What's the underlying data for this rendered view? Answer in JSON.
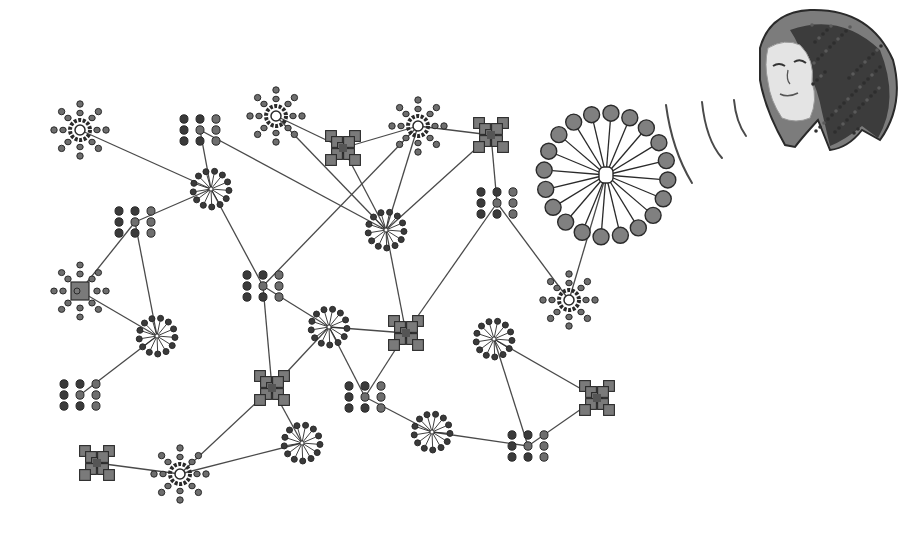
{
  "diagram": {
    "title": "",
    "width": 923,
    "height": 542,
    "colors": {
      "background": "#ffffff",
      "edge": "#4a4a4a",
      "node_fill": "#6e6e6e",
      "node_dark": "#3a3a3a",
      "node_stroke": "#2a2a2a",
      "x_fill": "#7a7a7a",
      "big_spoke_fill": "#808080",
      "face_skin": "#e4e4e4",
      "hair_dark": "#3c3c3c",
      "hair_mid": "#7c7c7c"
    },
    "nodes": [
      {
        "id": "A",
        "type": "sun",
        "x": 80,
        "y": 130
      },
      {
        "id": "B",
        "type": "grid",
        "x": 200,
        "y": 130
      },
      {
        "id": "C",
        "type": "sun",
        "x": 276,
        "y": 116
      },
      {
        "id": "D",
        "type": "x",
        "x": 343,
        "y": 148
      },
      {
        "id": "E",
        "type": "sun",
        "x": 418,
        "y": 126
      },
      {
        "id": "F",
        "type": "x",
        "x": 491,
        "y": 135
      },
      {
        "id": "G",
        "type": "spoke",
        "x": 211,
        "y": 189
      },
      {
        "id": "H",
        "type": "grid",
        "x": 135,
        "y": 222
      },
      {
        "id": "I",
        "type": "spoke",
        "x": 386,
        "y": 230
      },
      {
        "id": "J",
        "type": "grid",
        "x": 497,
        "y": 203
      },
      {
        "id": "K",
        "type": "bigspoke",
        "x": 606,
        "y": 175
      },
      {
        "id": "L",
        "type": "sunx",
        "x": 80,
        "y": 291
      },
      {
        "id": "M",
        "type": "spoke",
        "x": 157,
        "y": 336
      },
      {
        "id": "N",
        "type": "grid",
        "x": 263,
        "y": 286
      },
      {
        "id": "O",
        "type": "spoke",
        "x": 329,
        "y": 327
      },
      {
        "id": "P",
        "type": "x",
        "x": 406,
        "y": 333
      },
      {
        "id": "Q",
        "type": "spoke",
        "x": 494,
        "y": 339
      },
      {
        "id": "R",
        "type": "grid",
        "x": 80,
        "y": 395
      },
      {
        "id": "S",
        "type": "x",
        "x": 272,
        "y": 388
      },
      {
        "id": "T",
        "type": "grid",
        "x": 365,
        "y": 397
      },
      {
        "id": "U",
        "type": "sun",
        "x": 569,
        "y": 300
      },
      {
        "id": "V",
        "type": "x",
        "x": 597,
        "y": 398
      },
      {
        "id": "W",
        "type": "spoke",
        "x": 302,
        "y": 443
      },
      {
        "id": "X",
        "type": "spoke",
        "x": 432,
        "y": 432
      },
      {
        "id": "Y",
        "type": "grid",
        "x": 528,
        "y": 446
      },
      {
        "id": "Z",
        "type": "x",
        "x": 97,
        "y": 463
      },
      {
        "id": "AA",
        "type": "sun",
        "x": 180,
        "y": 474
      }
    ],
    "edges": [
      [
        "A",
        "G"
      ],
      [
        "B",
        "G"
      ],
      [
        "B",
        "I"
      ],
      [
        "C",
        "D"
      ],
      [
        "C",
        "I"
      ],
      [
        "D",
        "E"
      ],
      [
        "D",
        "I"
      ],
      [
        "E",
        "I"
      ],
      [
        "E",
        "N"
      ],
      [
        "E",
        "F"
      ],
      [
        "F",
        "I"
      ],
      [
        "F",
        "J"
      ],
      [
        "G",
        "H"
      ],
      [
        "G",
        "N"
      ],
      [
        "H",
        "L"
      ],
      [
        "H",
        "M"
      ],
      [
        "L",
        "M"
      ],
      [
        "M",
        "R"
      ],
      [
        "N",
        "O"
      ],
      [
        "N",
        "S"
      ],
      [
        "O",
        "P"
      ],
      [
        "O",
        "T"
      ],
      [
        "O",
        "S"
      ],
      [
        "I",
        "P"
      ],
      [
        "J",
        "P"
      ],
      [
        "J",
        "U"
      ],
      [
        "K",
        "U"
      ],
      [
        "S",
        "W"
      ],
      [
        "S",
        "AA"
      ],
      [
        "AA",
        "W"
      ],
      [
        "Z",
        "AA"
      ],
      [
        "P",
        "T"
      ],
      [
        "T",
        "X"
      ],
      [
        "X",
        "Y"
      ],
      [
        "Q",
        "V"
      ],
      [
        "Q",
        "Y"
      ],
      [
        "Y",
        "V"
      ]
    ],
    "sound_waves": [
      {
        "d": "M666 105 Q672 150 692 183"
      },
      {
        "d": "M702 102 Q706 140 722 158"
      },
      {
        "d": "M734 100 Q736 122 746 136"
      }
    ],
    "face": {
      "label": "person-head",
      "cx": 840,
      "cy": 75
    }
  }
}
